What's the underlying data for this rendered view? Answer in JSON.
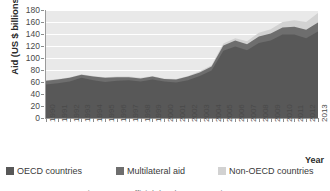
{
  "chart_data": {
    "type": "area",
    "stacked": true,
    "title": "",
    "xlabel": "Year",
    "ylabel": "Aid (US $ billions)",
    "ylim": [
      0,
      180
    ],
    "ytick_values": [
      0,
      20,
      40,
      60,
      80,
      100,
      120,
      140,
      160,
      180
    ],
    "grid": true,
    "grid_color": "#ffffff",
    "plot_background": "#e9e9e9",
    "legend_position": "bottom",
    "categories": [
      "1990",
      "1991",
      "1992",
      "1993",
      "1994",
      "1995",
      "1996",
      "1997",
      "1998",
      "1999",
      "2000",
      "2001",
      "2002",
      "2003",
      "2004",
      "2005",
      "2006",
      "2007",
      "2008",
      "2009",
      "2010",
      "2011",
      "2012",
      "2013"
    ],
    "series": [
      {
        "name": "OECD countries",
        "color": "#585858",
        "values": [
          56,
          58,
          61,
          67,
          63,
          60,
          62,
          63,
          61,
          64,
          61,
          59,
          63,
          70,
          79,
          112,
          119,
          113,
          125,
          129,
          139,
          139,
          133,
          144
        ]
      },
      {
        "name": "Multilateral aid",
        "color": "#6e6e6e",
        "values": [
          6,
          6,
          6,
          5,
          6,
          7,
          6,
          5,
          5,
          5,
          4,
          5,
          6,
          6,
          7,
          9,
          10,
          10,
          11,
          12,
          12,
          13,
          14,
          15
        ]
      },
      {
        "name": "Non-OECD countries",
        "color": "#d2d2d2",
        "values": [
          1,
          1,
          1,
          1,
          1,
          1,
          1,
          1,
          1,
          1,
          1,
          1,
          1,
          2,
          2,
          3,
          4,
          5,
          6,
          7,
          9,
          11,
          13,
          16
        ]
      }
    ],
    "totals": [
      63,
      65,
      68,
      73,
      70,
      68,
      69,
      69,
      67,
      70,
      66,
      65,
      70,
      78,
      88,
      124,
      133,
      128,
      142,
      148,
      160,
      163,
      160,
      175
    ],
    "annotations": []
  },
  "legend": {
    "items": [
      {
        "label": "OECD countries",
        "color": "#585858"
      },
      {
        "label": "Multilateral aid",
        "color": "#6e6e6e"
      },
      {
        "label": "Non-OECD countries",
        "color": "#d2d2d2"
      }
    ]
  },
  "axis": {
    "y_title": "Aid (US $ billions)",
    "x_title": "Year"
  },
  "caption": {
    "text": "Figure 10.5 Official development assistance"
  }
}
